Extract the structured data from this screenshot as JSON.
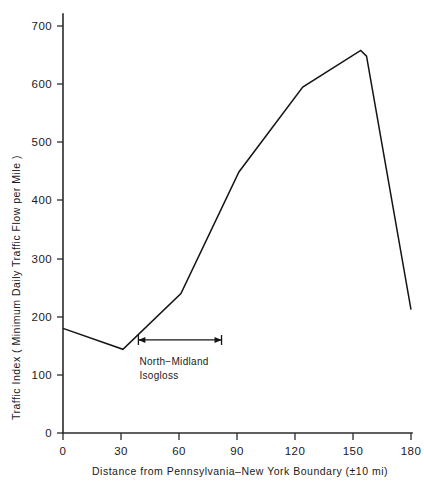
{
  "chart_data": {
    "type": "line",
    "title": "",
    "xlabel": "Distance from Pennsylvania–New York Boundary (±10 mi)",
    "ylabel": "Traffic Index  ( Minimum  Daily  Traffic  Flow  per  Mile )",
    "xlim": [
      0,
      180
    ],
    "ylim": [
      0,
      730
    ],
    "xticks": [
      0,
      30,
      60,
      90,
      120,
      150,
      180
    ],
    "xticklabels": [
      "0",
      "30",
      "60",
      "90",
      "120",
      "150",
      "180"
    ],
    "yticks": [
      0,
      100,
      200,
      300,
      400,
      500,
      600,
      700
    ],
    "yticklabels": [
      "0",
      "100",
      "200",
      "300",
      "400",
      "500",
      "600",
      "700"
    ],
    "grid": false,
    "legend": null,
    "series": [
      {
        "name": "Traffic Index",
        "x": [
          0,
          31,
          61,
          91,
          124,
          154,
          157,
          180
        ],
        "values": [
          180,
          144,
          240,
          449,
          595,
          658,
          648,
          212
        ]
      }
    ],
    "annotations": [
      {
        "name": "north-midland-isogloss",
        "text_line1": "North−Midland",
        "text_line2": "Isogloss",
        "arrow_x_start": 39,
        "arrow_x_end": 82,
        "arrow_y": 160,
        "style": "double-headed-arrow"
      }
    ],
    "colors": {
      "line": "#141414",
      "axis": "#2b2b2b",
      "text": "#1a1a1a",
      "background": "#ffffff"
    }
  },
  "figure": {
    "caption_fragment": ""
  }
}
